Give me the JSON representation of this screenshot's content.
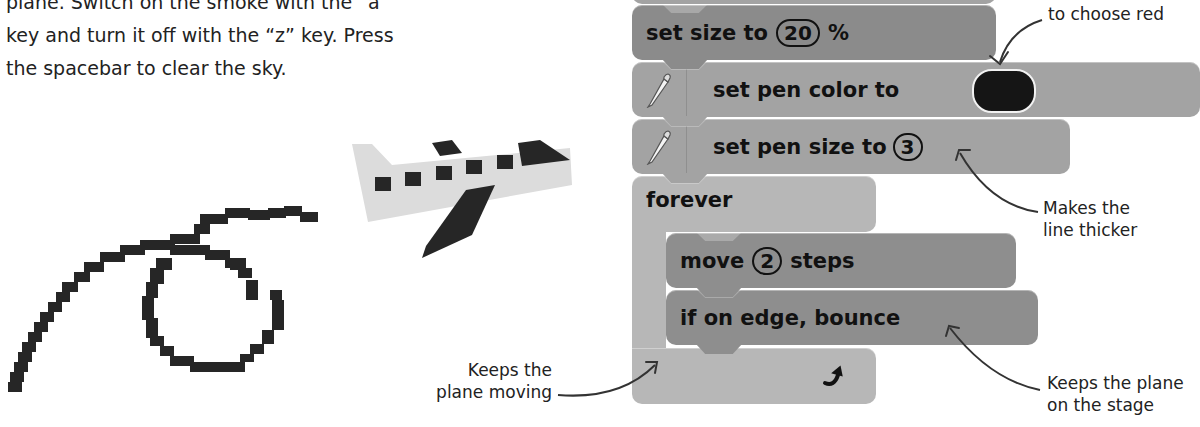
{
  "intro": {
    "lines": [
      "plane. Switch on the smoke with the “a”",
      "key and turn it off with the “z” key. Press",
      "the spacebar to clear the sky."
    ]
  },
  "script_blocks": {
    "set_size": {
      "label": "set size to",
      "value": "20",
      "suffix": "%"
    },
    "set_pen_color": {
      "label": "set pen color to",
      "icon": "pen-icon",
      "color": "#151515"
    },
    "set_pen_size": {
      "label": "set pen size to",
      "value": "3",
      "icon": "pen-icon"
    },
    "forever": {
      "label": "forever",
      "icon": "loop-arrow-icon"
    },
    "move": {
      "label_before": "move",
      "value": "2",
      "label_after": "steps"
    },
    "bounce": {
      "label": "if on edge, bounce"
    }
  },
  "annotations": {
    "choose_red": "to choose red",
    "thicker_1": "Makes the",
    "thicker_2": "line thicker",
    "moving_1": "Keeps the",
    "moving_2": "plane moving",
    "stage_1": "Keeps the plane",
    "stage_2": "on the stage"
  },
  "illustration": {
    "name": "pixel-plane-with-smoke-trail"
  },
  "colors": {
    "looks_block": "#8b8b8b",
    "pen_block": "#a3a3a3",
    "control_block": "#b7b7b7",
    "motion_block": "#8e8e8e",
    "pen_color_swatch": "#151515"
  }
}
